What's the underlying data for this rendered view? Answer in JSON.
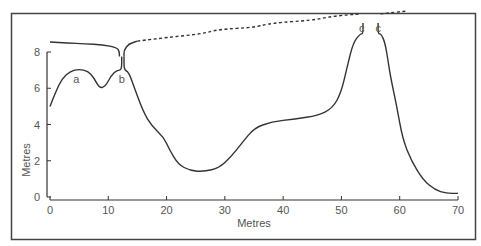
{
  "chart_data": {
    "type": "line",
    "title": "",
    "xlabel": "Metres",
    "ylabel": "Metres",
    "xlim": [
      0,
      70
    ],
    "ylim": [
      0,
      8
    ],
    "x_ticks": [
      0,
      10,
      20,
      30,
      40,
      50,
      60,
      70
    ],
    "y_ticks": [
      0,
      2,
      4,
      6,
      8
    ],
    "grid": false,
    "legend": null,
    "series": [
      {
        "name": "lower-profile",
        "style": "solid",
        "points": [
          [
            0,
            5.0
          ],
          [
            1,
            5.8
          ],
          [
            2,
            6.5
          ],
          [
            3.5,
            6.95
          ],
          [
            5,
            7.05
          ],
          [
            6.5,
            6.95
          ],
          [
            7.5,
            6.6
          ],
          [
            8.5,
            6.0
          ],
          [
            9.5,
            6.1
          ],
          [
            10.5,
            6.7
          ],
          [
            11.5,
            7.0
          ],
          [
            12.3,
            7.0
          ],
          [
            12.3,
            7.75
          ]
        ]
      },
      {
        "name": "upper-profile-left",
        "style": "solid",
        "points": [
          [
            0,
            8.55
          ],
          [
            3,
            8.5
          ],
          [
            6,
            8.45
          ],
          [
            9,
            8.4
          ],
          [
            11.5,
            8.25
          ],
          [
            11.9,
            8.0
          ],
          [
            11.9,
            7.75
          ]
        ]
      },
      {
        "name": "upper-profile-right",
        "style": "solid",
        "points": [
          [
            12.7,
            7.75
          ],
          [
            12.7,
            8.1
          ],
          [
            13.5,
            8.45
          ],
          [
            15,
            8.6
          ]
        ]
      },
      {
        "name": "valley-profile",
        "style": "solid",
        "points": [
          [
            12.7,
            7.75
          ],
          [
            12.7,
            7.0
          ],
          [
            13.5,
            6.9
          ],
          [
            14.5,
            6.0
          ],
          [
            16,
            4.7
          ],
          [
            17.5,
            3.9
          ],
          [
            19.5,
            3.3
          ],
          [
            20.5,
            2.6
          ],
          [
            22,
            1.8
          ],
          [
            24,
            1.45
          ],
          [
            26.5,
            1.4
          ],
          [
            29,
            1.6
          ],
          [
            31,
            2.2
          ],
          [
            33,
            3.0
          ],
          [
            35,
            3.8
          ],
          [
            38,
            4.15
          ],
          [
            42,
            4.3
          ],
          [
            46,
            4.5
          ],
          [
            48.5,
            4.9
          ],
          [
            50,
            5.8
          ],
          [
            51,
            7.2
          ],
          [
            52,
            8.5
          ],
          [
            53.2,
            9.0
          ],
          [
            53.7,
            9.0
          ],
          [
            53.7,
            9.6
          ]
        ]
      },
      {
        "name": "dashed-surface",
        "style": "dashed",
        "points": [
          [
            15,
            8.6
          ],
          [
            20,
            8.8
          ],
          [
            26,
            9.0
          ],
          [
            29,
            9.25
          ],
          [
            35,
            9.35
          ],
          [
            38,
            9.6
          ],
          [
            45,
            9.75
          ],
          [
            48,
            9.95
          ],
          [
            51,
            10.05
          ],
          [
            53.3,
            10.1
          ]
        ]
      },
      {
        "name": "right-cave-profile",
        "style": "solid",
        "points": [
          [
            56.3,
            9.6
          ],
          [
            56.3,
            9.0
          ],
          [
            56.8,
            9.0
          ],
          [
            57.5,
            8.5
          ],
          [
            58,
            7.5
          ],
          [
            58.5,
            6.5
          ],
          [
            59.5,
            5.0
          ],
          [
            60.5,
            3.2
          ],
          [
            62,
            2.0
          ],
          [
            64,
            0.95
          ],
          [
            66,
            0.4
          ],
          [
            68,
            0.2
          ],
          [
            70,
            0.2
          ]
        ]
      },
      {
        "name": "dashed-surface-right",
        "style": "dashed",
        "points": [
          [
            56.7,
            10.1
          ],
          [
            58,
            10.15
          ],
          [
            61,
            10.25
          ]
        ]
      }
    ],
    "annotations": [
      {
        "text": "a",
        "x": 4.5,
        "y": 6.5
      },
      {
        "text": "b",
        "x": 12.3,
        "y": 6.5
      },
      {
        "text": "c",
        "x": 53.5,
        "y": 9.3
      },
      {
        "text": "c",
        "x": 56.3,
        "y": 9.3
      }
    ]
  },
  "labels": {
    "xlabel": "Metres",
    "ylabel": "Metres",
    "x_ticks": [
      "0",
      "10",
      "20",
      "30",
      "40",
      "50",
      "60",
      "70"
    ],
    "y_ticks": [
      "0",
      "2",
      "4",
      "6",
      "8"
    ],
    "annotations": [
      "a",
      "b",
      "c",
      "c"
    ]
  }
}
